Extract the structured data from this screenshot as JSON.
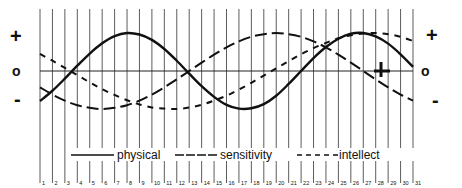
{
  "chart_data": {
    "type": "line",
    "title": "",
    "xlabel": "",
    "ylabel": "",
    "x": [
      1,
      2,
      3,
      4,
      5,
      6,
      7,
      8,
      9,
      10,
      11,
      12,
      13,
      14,
      15,
      16,
      17,
      18,
      19,
      20,
      21,
      22,
      23,
      24,
      25,
      26,
      27,
      28,
      29,
      30,
      31
    ],
    "ylim": [
      -1,
      1
    ],
    "y_tick_labels": [
      "+",
      "o",
      "-"
    ],
    "grid": "vertical lines per day",
    "legend_position": "bottom-inside",
    "series": [
      {
        "name": "physical",
        "style": "solid",
        "period": 23,
        "zero_up_day": 3.5,
        "values": [
          -0.79,
          -0.52,
          -0.2,
          0.14,
          0.46,
          0.73,
          0.92,
          1.0,
          0.96,
          0.82,
          0.58,
          0.27,
          -0.07,
          -0.4,
          -0.68,
          -0.89,
          -0.99,
          -0.98,
          -0.87,
          -0.65,
          -0.34,
          0.0,
          0.34,
          0.63,
          0.85,
          0.98,
          1.0,
          0.91,
          0.72,
          0.44,
          0.11
        ]
      },
      {
        "name": "sensitivity",
        "style": "long-dash",
        "period": 28,
        "zero_up_day": 13.5,
        "values": [
          -0.43,
          -0.62,
          -0.78,
          -0.9,
          -0.97,
          -1.0,
          -0.97,
          -0.9,
          -0.78,
          -0.62,
          -0.43,
          -0.22,
          0.0,
          0.22,
          0.43,
          0.62,
          0.78,
          0.9,
          0.97,
          1.0,
          0.97,
          0.9,
          0.78,
          0.62,
          0.43,
          0.22,
          0.0,
          -0.22,
          -0.43,
          -0.62,
          -0.78
        ]
      },
      {
        "name": "intellect",
        "style": "short-dash",
        "period": 33,
        "zero_down_day": 3.5,
        "values": [
          0.45,
          0.27,
          0.08,
          -0.11,
          -0.3,
          -0.48,
          -0.63,
          -0.77,
          -0.88,
          -0.96,
          -0.99,
          -1.0,
          -0.96,
          -0.89,
          -0.78,
          -0.65,
          -0.49,
          -0.31,
          -0.12,
          0.07,
          0.26,
          0.44,
          0.6,
          0.74,
          0.86,
          0.94,
          0.99,
          1.0,
          0.97,
          0.9,
          0.79
        ]
      }
    ]
  },
  "axis": {
    "plus": "+",
    "zero": "o",
    "minus": "-"
  },
  "legend": {
    "physical": "physical",
    "sensitivity": "sensitivity",
    "intellect": "intellect"
  },
  "day_labels": [
    "1",
    "2",
    "3",
    "4",
    "5",
    "6",
    "7",
    "8",
    "9",
    "10",
    "11",
    "12",
    "13",
    "14",
    "15",
    "16",
    "17",
    "18",
    "19",
    "20",
    "21",
    "22",
    "23",
    "24",
    "25",
    "26",
    "27",
    "28",
    "29",
    "30",
    "31"
  ],
  "colors": {
    "ink": "#111111",
    "grid": "#333333",
    "background": "#ffffff"
  }
}
